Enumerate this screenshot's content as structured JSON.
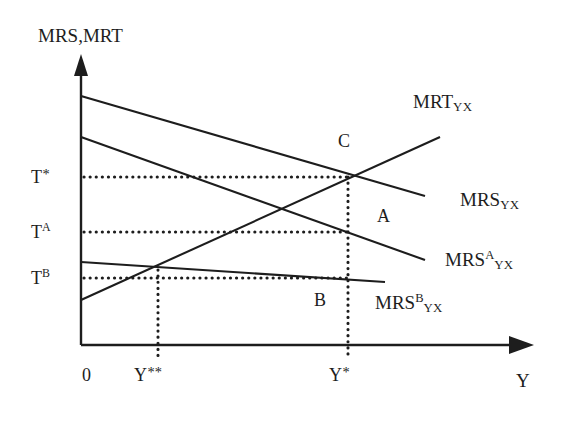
{
  "figure": {
    "type": "economics-line-diagram",
    "background_color": "#ffffff",
    "line_color": "#1d1d1d",
    "axis_title_y": "MRS,MRT",
    "axis_title_x": "Y",
    "origin_label": "0"
  },
  "axes": {
    "y_axis": {
      "name": "vertical-axis",
      "x": 81,
      "y_top": 57,
      "y_bottom": 345,
      "arrow": "up"
    },
    "x_axis": {
      "name": "horizontal-axis",
      "y": 345,
      "x_left": 81,
      "x_right": 533,
      "arrow": "right"
    }
  },
  "y_ticks": [
    {
      "label_text": "T",
      "superscript": "*",
      "value_y": 177,
      "label_x": 31,
      "label_y": 168
    },
    {
      "label_text": "T",
      "superscript": "A",
      "value_y": 232,
      "label_x": 31,
      "label_y": 223
    },
    {
      "label_text": "T",
      "superscript": "B",
      "value_y": 278,
      "label_x": 31,
      "label_y": 269
    }
  ],
  "x_ticks": [
    {
      "label_text": "Y",
      "superscript": "**",
      "value_x": 158,
      "label_x": 134,
      "label_y": 366
    },
    {
      "label_text": "Y",
      "superscript": "*",
      "value_x": 348,
      "label_x": 329,
      "label_y": 366
    }
  ],
  "curves": [
    {
      "id": "mrs-yx",
      "label_base": "MRS",
      "label_sub": "YX",
      "label_sup": "",
      "label_x": 460,
      "label_y": 190,
      "start": {
        "x": 81,
        "y": 96
      },
      "end": {
        "x": 425,
        "y": 196
      },
      "slope": "negative"
    },
    {
      "id": "mrs-a-yx",
      "label_base": "MRS",
      "label_sub": "YX",
      "label_sup": "A",
      "label_x": 445,
      "label_y": 250,
      "start": {
        "x": 81,
        "y": 137
      },
      "end": {
        "x": 425,
        "y": 260
      },
      "slope": "negative"
    },
    {
      "id": "mrs-b-yx",
      "label_base": "MRS",
      "label_sub": "YX",
      "label_sup": "B",
      "label_x": 375,
      "label_y": 293,
      "start": {
        "x": 81,
        "y": 262
      },
      "end": {
        "x": 385,
        "y": 282
      },
      "slope": "negative-shallow"
    },
    {
      "id": "mrt-yx",
      "label_base": "MRT",
      "label_sub": "YX",
      "label_sup": "",
      "label_x": 413,
      "label_y": 92,
      "start": {
        "x": 81,
        "y": 300
      },
      "end": {
        "x": 440,
        "y": 137
      },
      "slope": "positive"
    }
  ],
  "points": [
    {
      "name": "point-c",
      "label": "C",
      "x": 338,
      "y": 132,
      "marker_x": 348,
      "marker_y": 177
    },
    {
      "name": "point-a",
      "label": "A",
      "x": 377,
      "y": 207,
      "marker_x": 348,
      "marker_y": 232
    },
    {
      "name": "point-b",
      "label": "B",
      "x": 314,
      "y": 291,
      "marker_x": 348,
      "marker_y": 278
    }
  ],
  "guides": {
    "horizontal_dotted": [
      {
        "name": "guide-t-star",
        "y": 177,
        "x_from": 84,
        "x_to": 348
      },
      {
        "name": "guide-t-a",
        "y": 232,
        "x_from": 84,
        "x_to": 348
      },
      {
        "name": "guide-t-b",
        "y": 278,
        "x_from": 84,
        "x_to": 348
      }
    ],
    "vertical_dotted": [
      {
        "name": "guide-y-double-star",
        "x": 158,
        "y_from": 270,
        "y_to": 356
      },
      {
        "name": "guide-y-star",
        "x": 348,
        "y_from": 177,
        "y_to": 356
      }
    ]
  },
  "chart_data": {
    "type": "line",
    "title": "",
    "xlabel": "Y",
    "ylabel": "MRS,MRT",
    "grid": false,
    "legend": "inline-right",
    "xlim": [
      0,
      1
    ],
    "ylim": [
      0,
      1
    ],
    "annotations": [
      "C",
      "A",
      "B",
      "0"
    ],
    "tick_labels_y": [
      "T*",
      "T^A",
      "T^B"
    ],
    "tick_labels_x": [
      "Y**",
      "Y*"
    ],
    "series": [
      {
        "name": "MRS_YX",
        "x": [
          0,
          0.76
        ],
        "y": [
          0.865,
          0.517
        ],
        "direction": "decreasing"
      },
      {
        "name": "MRS^A_YX",
        "x": [
          0,
          0.76
        ],
        "y": [
          0.722,
          0.295
        ],
        "direction": "decreasing"
      },
      {
        "name": "MRS^B_YX",
        "x": [
          0,
          0.67
        ],
        "y": [
          0.288,
          0.219
        ],
        "direction": "decreasing"
      },
      {
        "name": "MRT_YX",
        "x": [
          0,
          0.79
        ],
        "y": [
          0.156,
          0.722
        ],
        "direction": "increasing"
      }
    ],
    "intersections": [
      {
        "label": "C",
        "x": 0.59,
        "y": 0.583,
        "note": "MRS_YX x MRT_YX at (Y*, T*)"
      },
      {
        "label": "A",
        "x": 0.59,
        "y": 0.392,
        "note": "MRS^A_YX at (Y*, T^A)"
      },
      {
        "label": "B",
        "x": 0.59,
        "y": 0.233,
        "note": "MRS^B_YX at (Y*, T^B)"
      },
      {
        "label": "",
        "x": 0.17,
        "y": 0.26,
        "note": "MRS^B_YX x MRT_YX at Y**"
      }
    ]
  }
}
